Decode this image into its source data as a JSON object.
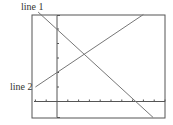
{
  "chart_data": {
    "type": "line",
    "title": "",
    "xlabel": "",
    "ylabel": "",
    "grid": false,
    "xlim": [
      -2.3,
      10
    ],
    "ylim": [
      -1.1,
      6
    ],
    "x_tick_step": 1,
    "y_tick_step": 1,
    "series": [
      {
        "name": "line 1",
        "slope": -0.667,
        "intercept": 5,
        "points": [
          [
            -1.75,
            6.17
          ],
          [
            8.9,
            -1.1
          ]
        ]
      },
      {
        "name": "line 2",
        "slope": 0.5,
        "intercept": 2,
        "points": [
          [
            -2.0,
            1.0
          ],
          [
            8.0,
            6.0
          ]
        ]
      }
    ],
    "intersection": [
      2.57,
      3.29
    ],
    "annotations": [
      "line 1",
      "line 2"
    ]
  },
  "labels": {
    "line1": "line 1",
    "line2": "line 2"
  },
  "colors": {
    "frame": "#555555",
    "axis": "#555555",
    "line": "#777777",
    "text": "#333333"
  }
}
